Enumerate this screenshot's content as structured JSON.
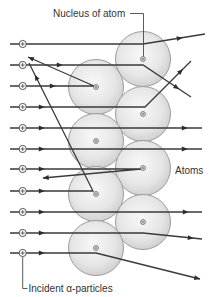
{
  "labels": {
    "nucleus": "Nucleus of atom",
    "atoms": "Atoms",
    "incident": "Incident α-particles"
  },
  "colors": {
    "track": "#3a3a3a",
    "atom_stroke": "#9c9c9c",
    "atom_fill_center": "#f6f6f6",
    "atom_fill_edge": "#d0d0d0",
    "text": "#333333"
  },
  "diagram": {
    "atom_radius": 27.5,
    "source_marker_x": 22.7,
    "atoms": [
      {
        "column": "right",
        "cx": 143,
        "cy": 59
      },
      {
        "column": "left",
        "cx": 96,
        "cy": 87
      },
      {
        "column": "right",
        "cx": 143,
        "cy": 114
      },
      {
        "column": "left",
        "cx": 96,
        "cy": 141
      },
      {
        "column": "right",
        "cx": 143,
        "cy": 168
      },
      {
        "column": "left",
        "cx": 96,
        "cy": 194
      },
      {
        "column": "right",
        "cx": 143,
        "cy": 222
      },
      {
        "column": "left",
        "cx": 96,
        "cy": 248
      }
    ],
    "particles": [
      {
        "outcome": "slight deflection up",
        "path": [
          [
            10,
            44
          ],
          [
            143,
            44
          ],
          [
            205,
            34
          ]
        ],
        "arrows": [
          [
            180,
            38.1,
            -9.2
          ]
        ]
      },
      {
        "outcome": "deflected down",
        "path": [
          [
            10,
            65
          ],
          [
            143,
            65
          ],
          [
            191,
            97
          ]
        ],
        "arrows": [
          [
            60,
            65,
            0
          ],
          [
            177,
            87.7,
            33.7
          ]
        ]
      },
      {
        "outcome": "backscattered",
        "path": [
          [
            10,
            86
          ],
          [
            94,
            86
          ],
          [
            28,
            57
          ]
        ],
        "arrows": [
          [
            53,
            86,
            0
          ],
          [
            30.5,
            58.1,
            203.7
          ]
        ]
      },
      {
        "outcome": "deflected up",
        "path": [
          [
            10,
            107
          ],
          [
            145,
            107
          ],
          [
            191,
            61
          ]
        ],
        "arrows": [
          [
            42,
            107,
            0
          ],
          [
            181,
            71,
            -45
          ]
        ]
      },
      {
        "outcome": "undeflected",
        "path": [
          [
            10,
            128
          ],
          [
            202,
            128
          ]
        ],
        "arrows": [
          [
            42,
            128,
            0
          ],
          [
            185,
            128,
            0
          ]
        ]
      },
      {
        "outcome": "undeflected",
        "path": [
          [
            10,
            149
          ],
          [
            202,
            149
          ]
        ],
        "arrows": [
          [
            42,
            149,
            0
          ],
          [
            185,
            149,
            0
          ]
        ]
      },
      {
        "outcome": "backscattered",
        "path": [
          [
            10,
            169
          ],
          [
            141,
            169
          ],
          [
            43,
            178
          ]
        ],
        "arrows": [
          [
            42,
            169,
            0
          ],
          [
            45.5,
            177.8,
            174.8
          ]
        ]
      },
      {
        "outcome": "backscattered",
        "path": [
          [
            10,
            191
          ],
          [
            93,
            191
          ],
          [
            29,
            63
          ]
        ],
        "arrows": [
          [
            42,
            191,
            0
          ],
          [
            36,
            77,
            -116.6
          ]
        ]
      },
      {
        "outcome": "undeflected",
        "path": [
          [
            10,
            212
          ],
          [
            202,
            212
          ]
        ],
        "arrows": [
          [
            42,
            212,
            0
          ],
          [
            186,
            212,
            0
          ]
        ]
      },
      {
        "outcome": "slight deflection down",
        "path": [
          [
            10,
            233
          ],
          [
            143,
            233
          ],
          [
            202,
            239
          ]
        ],
        "arrows": [
          [
            42,
            233,
            0
          ],
          [
            191,
            237.9,
            5.8
          ]
        ]
      },
      {
        "outcome": "deflected down",
        "path": [
          [
            10,
            253
          ],
          [
            96,
            253
          ],
          [
            200,
            279
          ]
        ],
        "arrows": [
          [
            42,
            253,
            0
          ],
          [
            197.5,
            278.4,
            14
          ]
        ]
      }
    ]
  }
}
